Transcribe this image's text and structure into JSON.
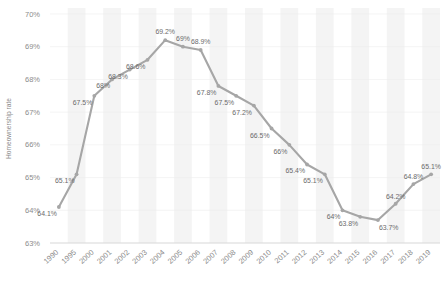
{
  "chart_data": {
    "type": "line",
    "title": "",
    "subtitle": "",
    "xlabel": "",
    "ylabel": "Homeownership rate",
    "ylim": [
      63,
      70
    ],
    "ytick_labels": [
      "63%",
      "64%",
      "65%",
      "66%",
      "67%",
      "68%",
      "69%",
      "70%"
    ],
    "ytick_values": [
      63,
      64,
      65,
      66,
      67,
      68,
      69,
      70
    ],
    "grid": false,
    "banded_background": true,
    "legend": "none",
    "categories": [
      "1990",
      "1995",
      "2000",
      "2001",
      "2002",
      "2003",
      "2004",
      "2005",
      "2006",
      "2007",
      "2008",
      "2009",
      "2010",
      "2011",
      "2012",
      "2013",
      "2014",
      "2015",
      "2016",
      "2017",
      "2018",
      "2019"
    ],
    "values": [
      64.1,
      65.1,
      67.5,
      68.0,
      68.3,
      68.6,
      69.2,
      69.0,
      68.9,
      67.8,
      67.5,
      67.2,
      66.5,
      66.0,
      65.4,
      65.1,
      64.0,
      63.8,
      63.7,
      64.2,
      64.8,
      65.1
    ],
    "data_labels": [
      "64.1%",
      "65.1%",
      "67.5%",
      "68%",
      "68.3%",
      "68.6%",
      "69.2%",
      "69%",
      "68.9%",
      "67.8%",
      "67.5%",
      "67.2%",
      "66.5%",
      "66%",
      "65.4%",
      "65.1%",
      "64%",
      "63.8%",
      "63.7%",
      "64.2%",
      "64.8%",
      "65.1%"
    ],
    "series_color": "#a6a6a6",
    "marker_color": "#a6a6a6",
    "band_color": "#f4f4f4",
    "axis_color": "#d9d9d9",
    "text_color": "#8c8c8c"
  }
}
